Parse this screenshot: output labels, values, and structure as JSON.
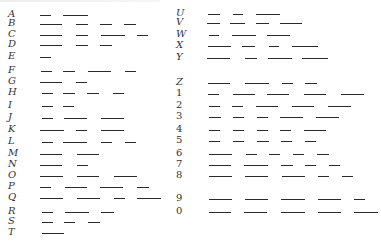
{
  "colors": {
    "ink": "#2a2a2a",
    "label": "#333333",
    "background": "#ffffff"
  },
  "rows": [
    {
      "label": "A",
      "col": "left",
      "y": 15,
      "dashes": [
        [
          40,
          11
        ],
        [
          63,
          25
        ]
      ]
    },
    {
      "label": "B",
      "col": "left",
      "y": 24,
      "dashes": [
        [
          40,
          22
        ],
        [
          76,
          12
        ],
        [
          100,
          12
        ],
        [
          124,
          12
        ]
      ]
    },
    {
      "label": "C",
      "col": "left",
      "y": 35,
      "dashes": [
        [
          40,
          22
        ],
        [
          76,
          12
        ],
        [
          101,
          24
        ],
        [
          137,
          11
        ]
      ]
    },
    {
      "label": "D",
      "col": "left",
      "y": 45,
      "dashes": [
        [
          40,
          22
        ],
        [
          76,
          12
        ],
        [
          100,
          12
        ]
      ]
    },
    {
      "label": "E",
      "col": "left",
      "y": 57,
      "dashes": [
        [
          40,
          11
        ]
      ]
    },
    {
      "label": "F",
      "col": "left",
      "y": 71,
      "dashes": [
        [
          41,
          11
        ],
        [
          63,
          12
        ],
        [
          88,
          23
        ],
        [
          125,
          11
        ]
      ]
    },
    {
      "label": "G",
      "col": "left",
      "y": 82,
      "dashes": [
        [
          40,
          22
        ],
        [
          76,
          11
        ]
      ]
    },
    {
      "label": "H",
      "col": "left",
      "y": 93,
      "dashes": [
        [
          42,
          11
        ],
        [
          63,
          12
        ],
        [
          87,
          12
        ],
        [
          113,
          11
        ]
      ]
    },
    {
      "label": "I",
      "col": "left",
      "y": 106,
      "dashes": [
        [
          42,
          11
        ],
        [
          63,
          11
        ]
      ]
    },
    {
      "label": "J",
      "col": "left",
      "y": 118,
      "dashes": [
        [
          42,
          11
        ],
        [
          64,
          23
        ],
        [
          101,
          23
        ]
      ]
    },
    {
      "label": "K",
      "col": "left",
      "y": 130,
      "dashes": [
        [
          40,
          24
        ],
        [
          76,
          11
        ],
        [
          101,
          23
        ]
      ]
    },
    {
      "label": "L",
      "col": "left",
      "y": 142,
      "dashes": [
        [
          42,
          11
        ],
        [
          63,
          24
        ],
        [
          101,
          11
        ],
        [
          125,
          11
        ]
      ]
    },
    {
      "label": "M",
      "col": "left",
      "y": 154,
      "dashes": [
        [
          40,
          22
        ],
        [
          77,
          22
        ]
      ]
    },
    {
      "label": "N",
      "col": "left",
      "y": 165,
      "dashes": [
        [
          40,
          22
        ],
        [
          77,
          11
        ]
      ]
    },
    {
      "label": "O",
      "col": "left",
      "y": 176,
      "dashes": [
        [
          40,
          23
        ],
        [
          77,
          22
        ],
        [
          114,
          23
        ]
      ]
    },
    {
      "label": "P",
      "col": "left",
      "y": 187,
      "dashes": [
        [
          40,
          11
        ],
        [
          65,
          22
        ],
        [
          100,
          23
        ],
        [
          137,
          12
        ]
      ]
    },
    {
      "label": "Q",
      "col": "left",
      "y": 198,
      "dashes": [
        [
          40,
          23
        ],
        [
          77,
          23
        ],
        [
          114,
          11
        ],
        [
          137,
          24
        ]
      ]
    },
    {
      "label": "R",
      "col": "left",
      "y": 212,
      "dashes": [
        [
          42,
          11
        ],
        [
          65,
          24
        ],
        [
          101,
          13
        ]
      ]
    },
    {
      "label": "S",
      "col": "left",
      "y": 222,
      "dashes": [
        [
          42,
          11
        ],
        [
          64,
          11
        ],
        [
          88,
          12
        ]
      ]
    },
    {
      "label": "T",
      "col": "left",
      "y": 233,
      "dashes": [
        [
          42,
          22
        ]
      ]
    },
    {
      "label": "U",
      "col": "right",
      "y": 14,
      "dashes": [
        [
          208,
          12
        ],
        [
          233,
          10
        ],
        [
          256,
          24
        ]
      ]
    },
    {
      "label": "V",
      "col": "right",
      "y": 23,
      "dashes": [
        [
          207,
          13
        ],
        [
          230,
          15
        ],
        [
          256,
          13
        ],
        [
          280,
          22
        ]
      ]
    },
    {
      "label": "W",
      "col": "right",
      "y": 35,
      "dashes": [
        [
          209,
          10
        ],
        [
          232,
          24
        ],
        [
          267,
          23
        ]
      ]
    },
    {
      "label": "X",
      "col": "right",
      "y": 46,
      "dashes": [
        [
          208,
          23
        ],
        [
          242,
          13
        ],
        [
          269,
          10
        ],
        [
          292,
          26
        ]
      ]
    },
    {
      "label": "Y",
      "col": "right",
      "y": 58,
      "dashes": [
        [
          207,
          23
        ],
        [
          245,
          12
        ],
        [
          268,
          24
        ],
        [
          302,
          26
        ]
      ]
    },
    {
      "label": "Z",
      "col": "right",
      "y": 83,
      "dashes": [
        [
          208,
          22
        ],
        [
          245,
          24
        ],
        [
          282,
          11
        ],
        [
          305,
          12
        ]
      ]
    },
    {
      "label": "1",
      "col": "right",
      "y": 94,
      "num": true,
      "dashes": [
        [
          208,
          11
        ],
        [
          233,
          22
        ],
        [
          267,
          22
        ],
        [
          304,
          22
        ],
        [
          341,
          23
        ]
      ]
    },
    {
      "label": "2",
      "col": "right",
      "y": 106,
      "num": true,
      "dashes": [
        [
          209,
          11
        ],
        [
          232,
          11
        ],
        [
          256,
          22
        ],
        [
          292,
          22
        ],
        [
          328,
          23
        ]
      ]
    },
    {
      "label": "3",
      "col": "right",
      "y": 117,
      "num": true,
      "dashes": [
        [
          209,
          12
        ],
        [
          233,
          11
        ],
        [
          257,
          11
        ],
        [
          280,
          23
        ],
        [
          316,
          23
        ]
      ]
    },
    {
      "label": "4",
      "col": "right",
      "y": 130,
      "num": true,
      "dashes": [
        [
          209,
          11
        ],
        [
          233,
          11
        ],
        [
          257,
          11
        ],
        [
          280,
          11
        ],
        [
          304,
          22
        ]
      ]
    },
    {
      "label": "5",
      "col": "right",
      "y": 141,
      "num": true,
      "dashes": [
        [
          209,
          11
        ],
        [
          233,
          11
        ],
        [
          257,
          12
        ],
        [
          281,
          11
        ],
        [
          305,
          11
        ]
      ]
    },
    {
      "label": "6",
      "col": "right",
      "y": 154,
      "num": true,
      "dashes": [
        [
          209,
          23
        ],
        [
          246,
          11
        ],
        [
          269,
          11
        ],
        [
          293,
          11
        ],
        [
          317,
          12
        ]
      ]
    },
    {
      "label": "7",
      "col": "right",
      "y": 165,
      "num": true,
      "dashes": [
        [
          209,
          22
        ],
        [
          244,
          24
        ],
        [
          281,
          12
        ],
        [
          305,
          11
        ],
        [
          329,
          11
        ]
      ]
    },
    {
      "label": "8",
      "col": "right",
      "y": 176,
      "num": true,
      "dashes": [
        [
          209,
          23
        ],
        [
          245,
          23
        ],
        [
          282,
          23
        ],
        [
          318,
          11
        ],
        [
          342,
          11
        ]
      ]
    },
    {
      "label": "9",
      "col": "right",
      "y": 199,
      "num": true,
      "dashes": [
        [
          209,
          23
        ],
        [
          245,
          23
        ],
        [
          281,
          24
        ],
        [
          318,
          23
        ],
        [
          354,
          11
        ]
      ]
    },
    {
      "label": "0",
      "col": "right",
      "y": 212,
      "num": true,
      "dashes": [
        [
          209,
          22
        ],
        [
          244,
          23
        ],
        [
          281,
          24
        ],
        [
          318,
          23
        ],
        [
          354,
          24
        ]
      ]
    }
  ]
}
